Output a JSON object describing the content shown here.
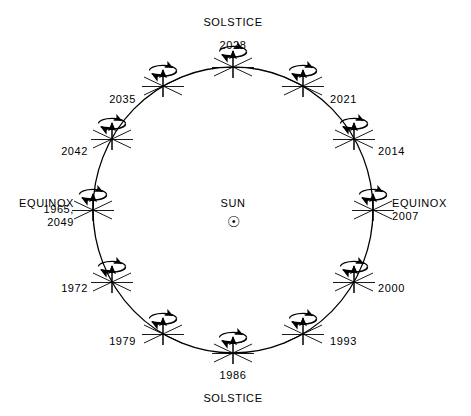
{
  "figure": {
    "title_top": "SOLSTICE",
    "title_bottom": "SOLSTICE",
    "center_label": "SUN",
    "center_symbol": "☉",
    "equinox_left": "EQUINOX",
    "equinox_left_years": "1965,\n2049",
    "equinox_right": "EQUINOX",
    "equinox_right_years": "2007",
    "stroke_color": "#000000",
    "background_color": "#ffffff"
  },
  "chart_data": {
    "type": "scatter",
    "xlabel": "",
    "ylabel": "",
    "orbit": {
      "center_x": 233,
      "center_y": 210,
      "radius_x": 140,
      "radius_y": 143
    },
    "categories": [
      "2028",
      "2021",
      "2014",
      "2007",
      "2000",
      "1993",
      "1986",
      "1979",
      "1972",
      "1965, 2049",
      "2042",
      "2035"
    ],
    "points": [
      {
        "year": "2028",
        "angle_deg": 90,
        "x": 233,
        "y": 67,
        "label_x": 233,
        "label_y": 45,
        "align": "c",
        "marker": "SOLSTICE"
      },
      {
        "year": "2021",
        "angle_deg": 60,
        "x": 303,
        "y": 86,
        "label_x": 330,
        "label_y": 99,
        "align": "l",
        "marker": ""
      },
      {
        "year": "2014",
        "angle_deg": 30,
        "x": 354,
        "y": 139,
        "label_x": 378,
        "label_y": 151,
        "align": "l",
        "marker": ""
      },
      {
        "year": "2007",
        "angle_deg": 0,
        "x": 373,
        "y": 210,
        "label_x": 392,
        "label_y": 216,
        "align": "l",
        "marker": "EQUINOX"
      },
      {
        "year": "2000",
        "angle_deg": -30,
        "x": 354,
        "y": 282,
        "label_x": 378,
        "label_y": 288,
        "align": "l",
        "marker": ""
      },
      {
        "year": "1993",
        "angle_deg": -60,
        "x": 303,
        "y": 334,
        "label_x": 330,
        "label_y": 341,
        "align": "l",
        "marker": ""
      },
      {
        "year": "1986",
        "angle_deg": -90,
        "x": 233,
        "y": 353,
        "label_x": 233,
        "label_y": 375,
        "align": "c",
        "marker": "SOLSTICE"
      },
      {
        "year": "1979",
        "angle_deg": -120,
        "x": 163,
        "y": 334,
        "label_x": 136,
        "label_y": 341,
        "align": "r",
        "marker": ""
      },
      {
        "year": "1972",
        "angle_deg": -150,
        "x": 112,
        "y": 282,
        "label_x": 88,
        "label_y": 288,
        "align": "r",
        "marker": ""
      },
      {
        "year": "1965, 2049",
        "angle_deg": 180,
        "x": 93,
        "y": 210,
        "label_x": 74,
        "label_y": 216,
        "align": "r",
        "marker": "EQUINOX"
      },
      {
        "year": "2042",
        "angle_deg": 150,
        "x": 112,
        "y": 139,
        "label_x": 88,
        "label_y": 151,
        "align": "r",
        "marker": ""
      },
      {
        "year": "2035",
        "angle_deg": 120,
        "x": 163,
        "y": 86,
        "label_x": 136,
        "label_y": 99,
        "align": "r",
        "marker": ""
      }
    ],
    "annotations": [
      {
        "text": "SOLSTICE",
        "x": 233,
        "y": 22
      },
      {
        "text": "SOLSTICE",
        "x": 233,
        "y": 398
      },
      {
        "text": "SUN",
        "x": 233,
        "y": 203
      },
      {
        "text": "EQUINOX",
        "x": 392,
        "y": 200
      },
      {
        "text": "EQUINOX",
        "x": 74,
        "y": 200
      }
    ],
    "grid": false,
    "legend": "none"
  }
}
